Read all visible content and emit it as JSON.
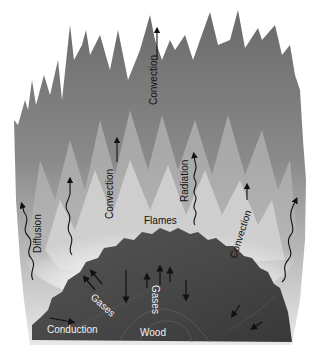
{
  "diagram": {
    "colors": {
      "flame_outer": "#6e6e6e",
      "flame_mid": "#9a9a9a",
      "flame_inner": "#d8d8d8",
      "glow": "#f4f4f4",
      "wood": "#4a4a4a",
      "wood_dark": "#3a3a3a",
      "arrow": "#111111"
    },
    "labels": {
      "convection_top": "Convection",
      "convection_left": "Convection",
      "convection_right": "Convection",
      "radiation": "Radiation",
      "diffusion": "Diffusion",
      "flames": "Flames",
      "gases_left": "Gases",
      "gases_center": "Gases",
      "conduction": "Conduction",
      "wood": "Wood"
    }
  }
}
